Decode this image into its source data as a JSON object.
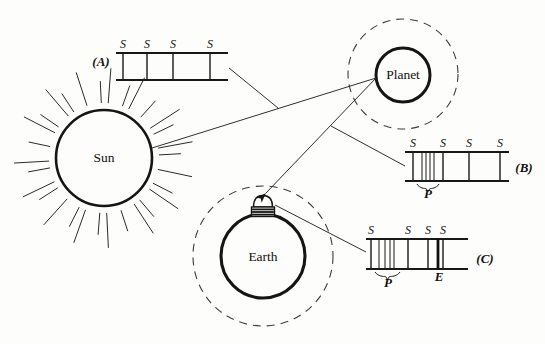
{
  "figure": {
    "background": "#fdfdfb",
    "ink": "#181818",
    "labels": {
      "sun": "Sun",
      "planet": "Planet",
      "earth": "Earth",
      "s": "S",
      "p": "P",
      "e": "E"
    },
    "sun": {
      "cx": 104,
      "cy": 158,
      "r": 48,
      "stroke": 2.6,
      "rays": {
        "count": 30,
        "inner": 55,
        "outer_short": 77,
        "outer_long": 90
      },
      "label_x": 104,
      "label_y": 162
    },
    "planet": {
      "cx": 403,
      "cy": 75,
      "r": 27,
      "stroke": 3,
      "orbit_r": 55,
      "label_x": 403,
      "label_y": 79
    },
    "earth": {
      "cx": 263,
      "cy": 256,
      "r": 42,
      "stroke": 3.1,
      "orbit_r": 70,
      "label_x": 263,
      "label_y": 261,
      "dome": {
        "base_x1": 251.5,
        "base_x2": 274.5,
        "base_top": 207,
        "base_bottom": 216.5,
        "dome_top": 195.5
      }
    },
    "spectra": [
      {
        "id": "A",
        "label": "(A)",
        "label_x": 101,
        "label_y": 66,
        "x1": 116,
        "x2": 228,
        "top": 53,
        "bottom": 80,
        "s_lines": [
          123,
          147,
          173,
          210
        ],
        "s_label_dy": -5,
        "p_lines": [],
        "p_brace": null,
        "e_line": null
      },
      {
        "id": "B",
        "label": "(B)",
        "label_x": 524,
        "label_y": 172,
        "x1": 405,
        "x2": 509,
        "top": 152,
        "bottom": 181,
        "s_lines": [
          413,
          443,
          469,
          500
        ],
        "s_label_dy": -5,
        "p_lines": [
          422,
          426,
          430,
          434
        ],
        "p_brace": {
          "x1": 417,
          "x2": 439,
          "y": 184,
          "label_x": 428,
          "label_y": 198
        },
        "e_line": null
      },
      {
        "id": "C",
        "label": "(C)",
        "label_x": 485,
        "label_y": 263,
        "x1": 366,
        "x2": 468,
        "top": 239,
        "bottom": 269,
        "s_lines": [
          371,
          408,
          428,
          443
        ],
        "s_label_dy": -5,
        "p_lines": [
          379,
          385,
          390,
          394
        ],
        "p_brace": {
          "x1": 375,
          "x2": 400,
          "y": 272,
          "label_x": 388,
          "label_y": 287
        },
        "e_line": {
          "x": 438,
          "label_x": 439,
          "label_y": 281
        }
      }
    ],
    "connectors": [
      {
        "name": "sun-to-planet-ray",
        "x1": 152,
        "y1": 148,
        "x2": 376,
        "y2": 78,
        "arrow": false
      },
      {
        "name": "spectrum-a-pointer",
        "x1": 229,
        "y1": 68,
        "x2": 278,
        "y2": 108,
        "arrow": false
      },
      {
        "name": "planet-to-telescope-ray",
        "x1": 376,
        "y1": 78,
        "x2": 266,
        "y2": 193,
        "arrow": true
      },
      {
        "name": "spectrum-b-pointer",
        "x1": 331,
        "y1": 126,
        "x2": 405,
        "y2": 166,
        "arrow": false
      },
      {
        "name": "telescope-to-spectrum-c",
        "x1": 275,
        "y1": 205,
        "x2": 366,
        "y2": 252,
        "arrow": false
      }
    ]
  }
}
